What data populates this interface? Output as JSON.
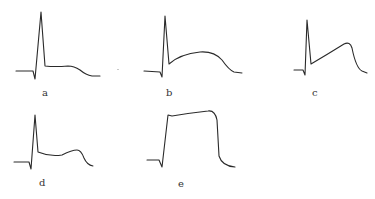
{
  "figure": {
    "panels": [
      {
        "id": "a",
        "label": "a",
        "description": "sharp spike followed by low flat plateau, then gradual decline",
        "path": "M16,71 L33,71 L35,79 L41,12 L45,66 Q55,67 68,66 Q74,66 80,70 Q86,75 92,76 L100,76",
        "label_pos": [
          42,
          88
        ]
      },
      {
        "id": "b",
        "label": "b",
        "description": "sharp spike followed by broad dome plateau",
        "path": "M144,71 L160,72 L162,77 L165,16 L169,64 Q180,54 200,52 Q214,51 222,60 Q229,70 234,72 L242,73",
        "label_pos": [
          166,
          88
        ]
      },
      {
        "id": "c",
        "label": "c",
        "description": "sharp spike followed by rising hump that peaks late then falls",
        "path": "M294,70 L303,70 L305,75 L307,20 L311,64 Q328,54 344,44 Q350,41 352,48 Q356,68 362,71 L367,73",
        "label_pos": [
          312,
          88
        ]
      },
      {
        "id": "d",
        "label": "d",
        "description": "sharp spike followed by low plateau with small late bump",
        "path": "M14,162 L29,162 L31,169 L35,115 L38,152 Q50,157 62,155 Q72,150 77,150 Q81,150 84,158 Q87,165 93,166",
        "label_pos": [
          39,
          178
        ]
      },
      {
        "id": "e",
        "label": "e",
        "description": "steep rise to high sustained flat plateau, then abrupt fall",
        "path": "M147,160 L159,160 L162,167 L168,115 L172,116 Q190,113 208,111 Q215,110 217,120 L219,156 Q222,166 235,167",
        "label_pos": [
          178,
          179
        ]
      }
    ]
  }
}
